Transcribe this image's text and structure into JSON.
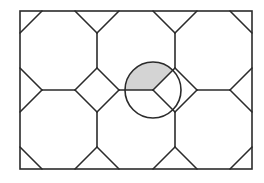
{
  "diagram": {
    "colors": {
      "background": "#ffffff",
      "stroke": "#2b2b2b",
      "shade": "#d4d4d4"
    },
    "stroke_width": 1.6,
    "border": {
      "x": 20,
      "y": 11,
      "width": 232,
      "height": 158
    },
    "segments": [
      [
        42,
        11,
        20,
        33
      ],
      [
        75,
        11,
        97,
        33
      ],
      [
        97,
        33,
        119,
        11
      ],
      [
        153,
        11,
        175,
        33
      ],
      [
        175,
        33,
        197,
        11
      ],
      [
        230,
        11,
        252,
        33
      ],
      [
        97,
        33,
        97,
        68
      ],
      [
        175,
        33,
        175,
        68
      ],
      [
        20,
        68,
        42,
        90
      ],
      [
        42,
        90,
        20,
        112
      ],
      [
        42,
        90,
        75,
        90
      ],
      [
        97,
        68,
        75,
        90
      ],
      [
        75,
        90,
        97,
        112
      ],
      [
        97,
        112,
        119,
        90
      ],
      [
        119,
        90,
        97,
        68
      ],
      [
        119,
        90,
        153,
        90
      ],
      [
        175,
        68,
        153,
        90
      ],
      [
        153,
        90,
        175,
        112
      ],
      [
        175,
        112,
        197,
        90
      ],
      [
        197,
        90,
        175,
        68
      ],
      [
        197,
        90,
        230,
        90
      ],
      [
        252,
        68,
        230,
        90
      ],
      [
        230,
        90,
        252,
        112
      ],
      [
        97,
        112,
        97,
        147
      ],
      [
        175,
        112,
        175,
        147
      ],
      [
        20,
        147,
        42,
        169
      ],
      [
        75,
        169,
        97,
        147
      ],
      [
        97,
        147,
        119,
        169
      ],
      [
        153,
        169,
        175,
        147
      ],
      [
        175,
        147,
        197,
        169
      ],
      [
        230,
        169,
        252,
        147
      ]
    ],
    "circle": {
      "cx": 153,
      "cy": 90,
      "r": 28
    },
    "shaded_sector": {
      "cx": 153,
      "cy": 90,
      "r": 28,
      "start_deg": 45,
      "end_deg": 180,
      "angle_deg": 135
    }
  }
}
